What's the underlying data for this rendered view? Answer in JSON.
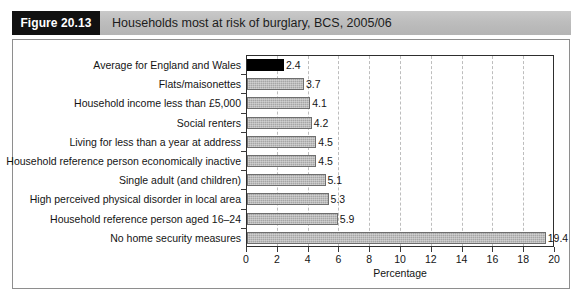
{
  "figure": {
    "number_label": "Figure 20.13",
    "caption": "Households most at risk of burglary, BCS, 2005/06"
  },
  "chart_data": {
    "type": "bar",
    "orientation": "horizontal",
    "title": "Households most at risk of burglary, BCS, 2005/06",
    "xlabel": "Percentage",
    "ylabel": "",
    "xlim": [
      0,
      20
    ],
    "xticks": [
      0,
      2,
      4,
      6,
      8,
      10,
      12,
      14,
      16,
      18,
      20
    ],
    "grid": "vertical-dashed",
    "legend": null,
    "colors": {
      "bar_fill": "#a6a6a6",
      "bar_edge": "#6e6e6e",
      "highlight_fill": "#000000",
      "gridline": "#bdbdbd",
      "header_band": "#bdbdbd",
      "figure_box": "#111111"
    },
    "categories": [
      "Average for England and Wales",
      "Flats/maisonettes",
      "Household income less than £5,000",
      "Social renters",
      "Living for less than a year at address",
      "Household reference person economically inactive",
      "Single adult (and children)",
      "High perceived physical disorder in local area",
      "Household reference person aged 16–24",
      "No home security measures"
    ],
    "values": [
      2.4,
      3.7,
      4.1,
      4.2,
      4.5,
      4.5,
      5.1,
      5.3,
      5.9,
      19.4
    ],
    "value_labels": [
      "2.4",
      "3.7",
      "4.1",
      "4.2",
      "4.5",
      "4.5",
      "5.1",
      "5.3",
      "5.9",
      "19.4"
    ],
    "highlight_index": 0
  }
}
